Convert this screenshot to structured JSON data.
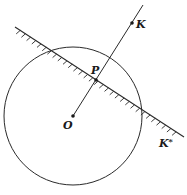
{
  "diagram": {
    "type": "geometry",
    "colors": {
      "stroke": "#2a2a2a",
      "background": "#ffffff"
    },
    "circle": {
      "center_label": "O",
      "cx": 73,
      "cy": 116,
      "r": 69
    },
    "points": [
      {
        "id": "O",
        "label": "O",
        "x": 73,
        "y": 116
      },
      {
        "id": "P",
        "label": "P",
        "x": 96,
        "y": 80
      },
      {
        "id": "K",
        "label": "K",
        "x": 132,
        "y": 23
      },
      {
        "id": "K_star",
        "label": "K*",
        "x": 172,
        "y": 141
      }
    ],
    "ray": {
      "from": "O",
      "through": [
        "P",
        "K"
      ],
      "x1": 73,
      "y1": 116,
      "x2": 143,
      "y2": 5
    },
    "hatched_line": {
      "x1": 15,
      "y1": 27,
      "x2": 184,
      "y2": 137,
      "hatch_side": "lower-left"
    },
    "labels": {
      "O": "O",
      "P": "P",
      "K": "K",
      "K_star_base": "K",
      "K_star_sup": "*"
    }
  }
}
